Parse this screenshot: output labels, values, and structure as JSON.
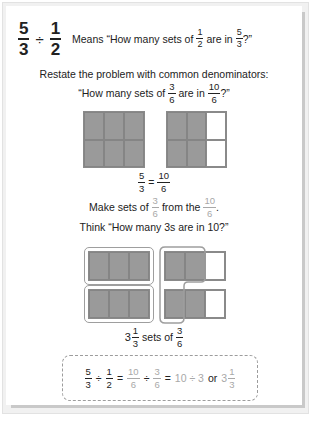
{
  "header": {
    "expression": {
      "a_num": "5",
      "a_den": "3",
      "op": "÷",
      "b_num": "1",
      "b_den": "2"
    },
    "meaning_prefix": "Means “How many sets of",
    "meaning_frac1": {
      "num": "1",
      "den": "2"
    },
    "meaning_mid": "are in",
    "meaning_frac2": {
      "num": "5",
      "den": "3"
    },
    "meaning_suffix": "?”"
  },
  "restate": {
    "line1": "Restate the problem with common denominators:",
    "line2_prefix": "“How many sets of",
    "line2_frac1": {
      "num": "3",
      "den": "6"
    },
    "line2_mid": "are in",
    "line2_frac2": {
      "num": "10",
      "den": "6"
    },
    "line2_suffix": "?”"
  },
  "grids": [
    {
      "rows": 2,
      "cols": 3,
      "shaded": 6
    },
    {
      "rows": 2,
      "cols": 3,
      "shaded": 4
    }
  ],
  "equation1": {
    "left": {
      "num": "5",
      "den": "3"
    },
    "op": "=",
    "right": {
      "num": "10",
      "den": "6"
    }
  },
  "make_sets": {
    "prefix": "Make sets of",
    "frac1": {
      "num": "3",
      "den": "6"
    },
    "mid": "from the",
    "frac2": {
      "num": "10",
      "den": "6"
    },
    "suffix": "."
  },
  "think": "Think “How many 3s are in 10?”",
  "result": {
    "whole": "3",
    "frac": {
      "num": "1",
      "den": "3"
    },
    "mid": "sets of",
    "frac2": {
      "num": "3",
      "den": "6"
    }
  },
  "summary": {
    "f1": {
      "num": "5",
      "den": "3"
    },
    "op1": "÷",
    "f2": {
      "num": "1",
      "den": "2"
    },
    "eq1": "=",
    "f3": {
      "num": "10",
      "den": "6"
    },
    "op2": "÷",
    "f4": {
      "num": "3",
      "den": "6"
    },
    "eq2": "=",
    "expr": "10 ÷ 3",
    "or": "or",
    "whole": "3",
    "f5": {
      "num": "1",
      "den": "3"
    }
  },
  "colors": {
    "shaded": "#9a9a9a",
    "grid_line": "#858585",
    "highlight_gray": "#a8a8a8",
    "group_outline": "#9e9e9e"
  }
}
